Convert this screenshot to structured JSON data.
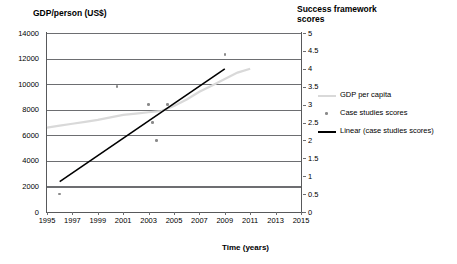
{
  "chart_data": {
    "type": "scatter",
    "title": "",
    "xlabel": "Time (years)",
    "ylabel": "GDP/person (US$)",
    "ylabel_right": "Success framework\nscores",
    "xlim": [
      1995,
      2015
    ],
    "ylim": [
      0,
      14000
    ],
    "ylim_right": [
      0,
      5
    ],
    "grid": true,
    "legend_position": "right",
    "xticks": [
      1995,
      1997,
      1999,
      2001,
      2003,
      2005,
      2007,
      2009,
      2011,
      2013,
      2015
    ],
    "yticks_left": [
      0,
      2000,
      4000,
      6000,
      8000,
      10000,
      12000,
      14000
    ],
    "yticks_right": [
      0,
      0.5,
      1,
      1.5,
      2,
      2.5,
      3,
      3.5,
      4,
      4.5,
      5
    ],
    "series": [
      {
        "name": "GDP per capita",
        "type": "line",
        "color": "#d9d9d9",
        "axis": "left",
        "x": [
          1995,
          1996,
          1997,
          1998,
          1999,
          2000,
          2001,
          2002,
          2003,
          2004,
          2005,
          2006,
          2007,
          2008,
          2009,
          2010,
          2011
        ],
        "values": [
          6600,
          6750,
          6900,
          7050,
          7200,
          7400,
          7600,
          7700,
          7800,
          7900,
          8300,
          8800,
          9400,
          9900,
          10400,
          10900,
          11200
        ]
      },
      {
        "name": "Case studies scores",
        "type": "scatter",
        "color": "#8a8a8a",
        "axis": "right",
        "x": [
          1996,
          2000.5,
          2003,
          2003.3,
          2003.6,
          2004.5,
          2009
        ],
        "values": [
          0.5,
          3.5,
          3.0,
          2.5,
          2.0,
          3.0,
          4.4
        ]
      },
      {
        "name": "Linear (case studies scores)",
        "type": "line",
        "color": "#000000",
        "axis": "right",
        "x": [
          1996,
          2009
        ],
        "values": [
          0.85,
          4.0
        ]
      }
    ],
    "legend": [
      {
        "label": "GDP per capita",
        "marker": "line",
        "color": "#d9d9d9"
      },
      {
        "label": "Case studies scores",
        "marker": "dot",
        "color": "#8a8a8a"
      },
      {
        "label": "Linear (case studies scores)",
        "marker": "line",
        "color": "#000000"
      }
    ]
  }
}
